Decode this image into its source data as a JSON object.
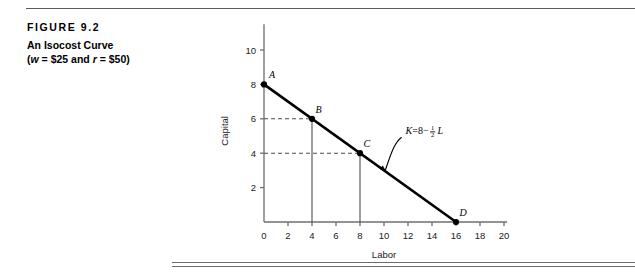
{
  "figure": {
    "label": "FIGURE 9.2",
    "title": "An Isocost Curve",
    "subtitle_prefix": "(",
    "subtitle_w": "w",
    "subtitle_mid": " = $25 and ",
    "subtitle_r": "r",
    "subtitle_suffix": " = $50)"
  },
  "colors": {
    "line": "#000000",
    "axis": "#6e6e6e",
    "text": "#1a1a1a",
    "rule": "#6b6b6b",
    "dashed": "#4d4d4d"
  },
  "chart_data": {
    "type": "line",
    "title": "An Isocost Curve (w = $25 and r = $50)",
    "xlabel": "Labor",
    "ylabel": "Capital",
    "xlim": [
      0,
      20
    ],
    "ylim": [
      0,
      11.5
    ],
    "xticks": [
      0,
      2,
      4,
      6,
      8,
      10,
      12,
      14,
      16,
      18,
      20
    ],
    "yticks": [
      2,
      4,
      6,
      8,
      10
    ],
    "x_origin_label": "0",
    "grid": false,
    "legend": "none",
    "series": [
      {
        "name": "Isocost line K = 8 - 1/2 L",
        "x": [
          0,
          16
        ],
        "y": [
          8,
          0
        ]
      }
    ],
    "annotations": [
      {
        "label": "K = 8 - 1/2 L",
        "equation_lhs": "K",
        "equation_eq": " = ",
        "equation_intercept": "8",
        "equation_minus": " − ",
        "frac_num": "1",
        "frac_den": "2",
        "equation_var": "L",
        "x": 11.8,
        "y": 5.1,
        "arrow_to_x": 10.1,
        "arrow_to_y": 3.0
      }
    ],
    "points": [
      {
        "label": "A",
        "x": 0,
        "y": 8,
        "droplines": false
      },
      {
        "label": "B",
        "x": 4,
        "y": 6,
        "droplines": true
      },
      {
        "label": "C",
        "x": 8,
        "y": 4,
        "droplines": true
      },
      {
        "label": "D",
        "x": 16,
        "y": 0,
        "droplines": false
      }
    ]
  }
}
